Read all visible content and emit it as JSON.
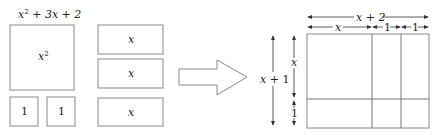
{
  "title_expression": {
    "base1": "x",
    "sup1": "2",
    "rest": " + 3x + 2"
  },
  "tiles": {
    "big_square": {
      "label": "x",
      "sup": "2"
    },
    "unit_squares": [
      {
        "label": "1"
      },
      {
        "label": "1"
      }
    ],
    "rectangles": [
      {
        "label": "x"
      },
      {
        "label": "x"
      },
      {
        "label": "x"
      }
    ]
  },
  "transform_arrow": {
    "icon": "right-arrow-icon"
  },
  "result": {
    "width_label": "x + 2",
    "width_parts": [
      "x",
      "1",
      "1"
    ],
    "height_label": "x + 1",
    "height_parts": [
      "x",
      "1"
    ]
  },
  "colors": {
    "stroke": "#888888",
    "text": "#222222"
  }
}
